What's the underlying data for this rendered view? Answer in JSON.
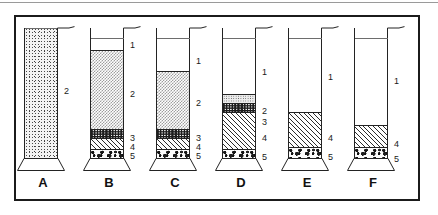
{
  "figure": {
    "border_color": "#1b1b1b",
    "background_color": "#ffffff",
    "cylinder_count": 6
  },
  "legend_keys": {
    "1": "clear supernatant",
    "2": "suspended fines",
    "3": "dark fine band",
    "4": "hatched settled layer",
    "5": "coarse basal sediment"
  },
  "cylinders": [
    {
      "caption": "A",
      "left": 20,
      "layers": [
        {
          "key": "2",
          "pattern": "stipple-dense",
          "height_pct": 100,
          "divider": false
        }
      ],
      "callouts": [
        {
          "label": "2",
          "top": 72
        }
      ]
    },
    {
      "caption": "B",
      "left": 86,
      "layers": [
        {
          "key": "1",
          "pattern": "empty",
          "height_pct": 17,
          "divider": false
        },
        {
          "key": "2",
          "pattern": "checker",
          "height_pct": 60,
          "divider": true
        },
        {
          "key": "3",
          "pattern": "dark",
          "height_pct": 7,
          "divider": true
        },
        {
          "key": "4",
          "pattern": "hatch",
          "height_pct": 8,
          "divider": true
        },
        {
          "key": "5",
          "pattern": "gravel",
          "height_pct": 8,
          "divider": true
        }
      ],
      "callouts": [
        {
          "label": "1",
          "top": 26
        },
        {
          "label": "2",
          "top": 75
        },
        {
          "label": "3",
          "top": 119
        },
        {
          "label": "4",
          "top": 128
        },
        {
          "label": "5",
          "top": 137
        }
      ]
    },
    {
      "caption": "C",
      "left": 152,
      "layers": [
        {
          "key": "1",
          "pattern": "empty",
          "height_pct": 33,
          "divider": false
        },
        {
          "key": "2",
          "pattern": "checker",
          "height_pct": 44,
          "divider": true
        },
        {
          "key": "3",
          "pattern": "dark",
          "height_pct": 7,
          "divider": true
        },
        {
          "key": "4",
          "pattern": "hatch",
          "height_pct": 8,
          "divider": true
        },
        {
          "key": "5",
          "pattern": "gravel",
          "height_pct": 8,
          "divider": true
        }
      ],
      "callouts": [
        {
          "label": "1",
          "top": 42
        },
        {
          "label": "2",
          "top": 84
        },
        {
          "label": "3",
          "top": 119
        },
        {
          "label": "4",
          "top": 128
        },
        {
          "label": "5",
          "top": 137
        }
      ]
    },
    {
      "caption": "D",
      "left": 218,
      "layers": [
        {
          "key": "1",
          "pattern": "empty",
          "height_pct": 50,
          "divider": false
        },
        {
          "key": "2",
          "pattern": "stipple-light",
          "height_pct": 7,
          "divider": true
        },
        {
          "key": "3",
          "pattern": "dark",
          "height_pct": 7,
          "divider": true
        },
        {
          "key": "4",
          "pattern": "hatch",
          "height_pct": 28,
          "divider": true
        },
        {
          "key": "5",
          "pattern": "gravel",
          "height_pct": 8,
          "divider": true
        }
      ],
      "callouts": [
        {
          "label": "1",
          "top": 53
        },
        {
          "label": "2",
          "top": 92
        },
        {
          "label": "3",
          "top": 103
        },
        {
          "label": "4",
          "top": 119
        },
        {
          "label": "5",
          "top": 138
        }
      ]
    },
    {
      "caption": "E",
      "left": 284,
      "layers": [
        {
          "key": "1",
          "pattern": "empty",
          "height_pct": 64,
          "divider": false
        },
        {
          "key": "4",
          "pattern": "hatch",
          "height_pct": 27,
          "divider": true
        },
        {
          "key": "5",
          "pattern": "gravel",
          "height_pct": 9,
          "divider": true
        }
      ],
      "callouts": [
        {
          "label": "1",
          "top": 58
        },
        {
          "label": "4",
          "top": 119
        },
        {
          "label": "5",
          "top": 138
        }
      ]
    },
    {
      "caption": "F",
      "left": 350,
      "layers": [
        {
          "key": "1",
          "pattern": "empty",
          "height_pct": 74,
          "divider": false
        },
        {
          "key": "4",
          "pattern": "hatch",
          "height_pct": 17,
          "divider": true
        },
        {
          "key": "5",
          "pattern": "gravel",
          "height_pct": 9,
          "divider": true
        }
      ],
      "callouts": [
        {
          "label": "1",
          "top": 62
        },
        {
          "label": "4",
          "top": 125
        },
        {
          "label": "5",
          "top": 140
        }
      ]
    }
  ]
}
